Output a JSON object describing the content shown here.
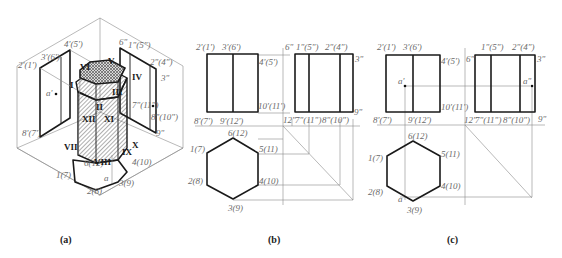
{
  "figure": {
    "captions": {
      "a": "(a)",
      "b": "(b)",
      "c": "(c)"
    }
  },
  "panel_a": {
    "type": "isometric projection of hexagonal prism onto V, H, W planes",
    "front_view_labels": [
      "2'(1')",
      "3'(6')",
      "4'(5')",
      "a'",
      "8'(7')"
    ],
    "side_view_labels": [
      "6\"",
      "1\"(5\")",
      "2\"(4\")",
      "3\"",
      "7\"(11\")",
      "8\"(10\")",
      "9\"",
      "a\""
    ],
    "top_view_labels": [
      "1(7)",
      "2(8)",
      "3(9)",
      "4(10)",
      "6(12)",
      "a"
    ],
    "roman_vertices": [
      "I",
      "II",
      "III",
      "IV",
      "V",
      "VI",
      "VII",
      "VIII",
      "IX",
      "X",
      "XI",
      "XII"
    ],
    "visible_roman": {
      "I": "I",
      "III": "III",
      "IV": "IV",
      "V": "V",
      "VI": "VI",
      "VII": "VII",
      "VIII": "VIII",
      "IX": "IX",
      "X": "X",
      "XI": "XI",
      "XII": "XII",
      "II": "II"
    }
  },
  "panel_b": {
    "front_view": {
      "top_labels": [
        "2'(1')",
        "3'(6')"
      ],
      "right_labels": [
        "4'(5')",
        "10'(11')"
      ],
      "bottom_labels": [
        "8'(7')",
        "9'(12')"
      ]
    },
    "side_view": {
      "top_labels": [
        "6\"",
        "1\"(5\")",
        "2\"(4\")",
        "3\""
      ],
      "bottom_labels": [
        "12\"",
        "7\"(11\")",
        "8\"(10\")",
        "9\""
      ]
    },
    "top_view": {
      "vertex_labels": [
        "6(12)",
        "5(11)",
        "4(10)",
        "3(9)",
        "2(8)",
        "1(7)"
      ]
    }
  },
  "panel_c": {
    "front_view": {
      "top_labels": [
        "2'(1')",
        "3'(6')"
      ],
      "right_labels": [
        "4'(5')",
        "10'(11')"
      ],
      "bottom_labels": [
        "8'(7')",
        "9'(12')"
      ],
      "point": "a'"
    },
    "side_view": {
      "top_labels": [
        "6\"",
        "1\"(5\")",
        "2\"(4\")",
        "3\""
      ],
      "bottom_labels": [
        "12\"",
        "7\"(11\")",
        "8\"(10\")",
        "9\""
      ],
      "point": "a\""
    },
    "top_view": {
      "vertex_labels": [
        "6(12)",
        "5(11)",
        "4(10)",
        "3(9)",
        "2(8)",
        "1(7)"
      ],
      "point": "a"
    }
  }
}
